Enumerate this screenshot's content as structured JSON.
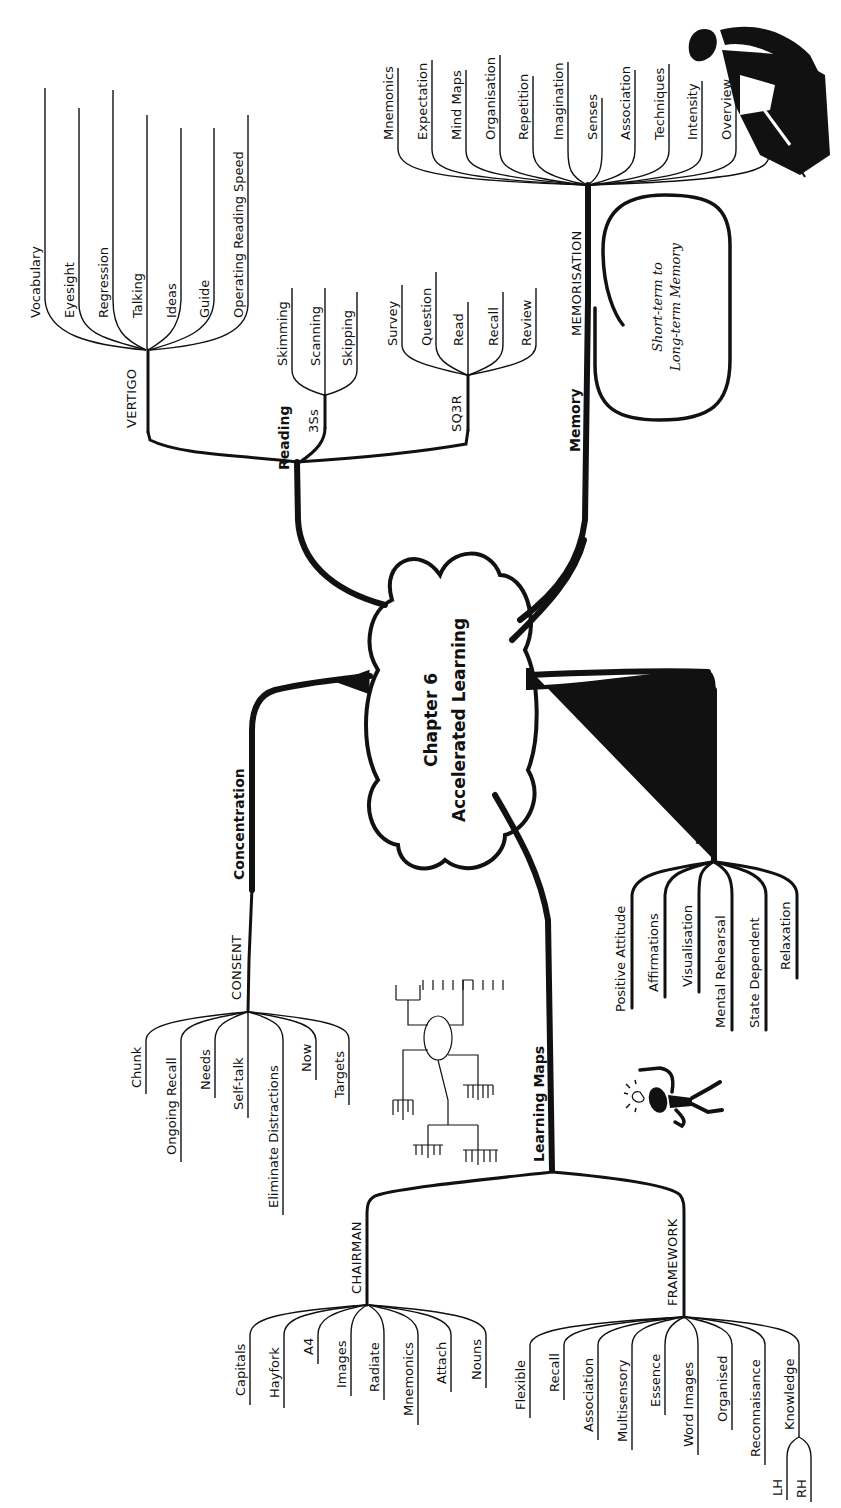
{
  "title": "Chapter 6 Accelerated Learning",
  "center": {
    "line1": "Chapter 6",
    "line2": "Accelerated Learning"
  },
  "colors": {
    "ink": "#111111",
    "background": "#ffffff"
  },
  "branches": {
    "reading": {
      "label": "Reading",
      "sub": {
        "vertigo": {
          "label": "VERTIGO",
          "items": [
            "Vocabulary",
            "Eyesight",
            "Regression",
            "Talking",
            "Ideas",
            "Guide",
            "Operating Reading Speed"
          ]
        },
        "three_s": {
          "label": "3Ss",
          "items": [
            "Skimming",
            "Scanning",
            "Skipping"
          ]
        },
        "sq3r": {
          "label": "SQ3R",
          "items": [
            "Survey",
            "Question",
            "Read",
            "Recall",
            "Review"
          ]
        }
      }
    },
    "memory": {
      "label": "Memory",
      "sub": {
        "memorisation": {
          "label": "MEMORISATION",
          "items": [
            "Mnemonics",
            "Expectation",
            "Mind Maps",
            "Organisation",
            "Repetition",
            "Imagination",
            "Senses",
            "Association",
            "Techniques",
            "Intensity",
            "Overview",
            "Novelty"
          ]
        }
      },
      "bubble": {
        "line1": "Short-term to",
        "line2": "Long-term Memory"
      }
    },
    "learning_states": {
      "label": "Learning States",
      "items": [
        "Positive Attitude",
        "Affirmations",
        "Visualisation",
        "Mental Rehearsal",
        "State Dependent",
        "Relaxation"
      ]
    },
    "concentration": {
      "label": "Concentration",
      "sub": {
        "consent": {
          "label": "CONSENT",
          "items": [
            "Chunk",
            "Ongoing Recall",
            "Needs",
            "Self-talk",
            "Eliminate Distractions",
            "Now",
            "Targets"
          ]
        }
      }
    },
    "learning_maps": {
      "label": "Learning Maps",
      "sub": {
        "chairman": {
          "label": "CHAIRMAN",
          "items": [
            "Capitals",
            "Hayfork",
            "A4",
            "Images",
            "Radiate",
            "Mnemonics",
            "Attach",
            "Nouns"
          ]
        },
        "framework": {
          "label": "FRAMEWORK",
          "items": [
            "Flexible",
            "Recall",
            "Association",
            "Multisensory",
            "Essence",
            "Word Images",
            "Organised",
            "Reconnaisance",
            "Knowledge"
          ],
          "knowledge_sub": [
            "LH",
            "RH"
          ]
        }
      }
    }
  },
  "illustrations": {
    "reader_silhouette": "person-reading-icon",
    "stick_figure": "idea-lightbulb-figure-icon",
    "mini_mind_map": "mind-map-thumbnail-icon"
  }
}
